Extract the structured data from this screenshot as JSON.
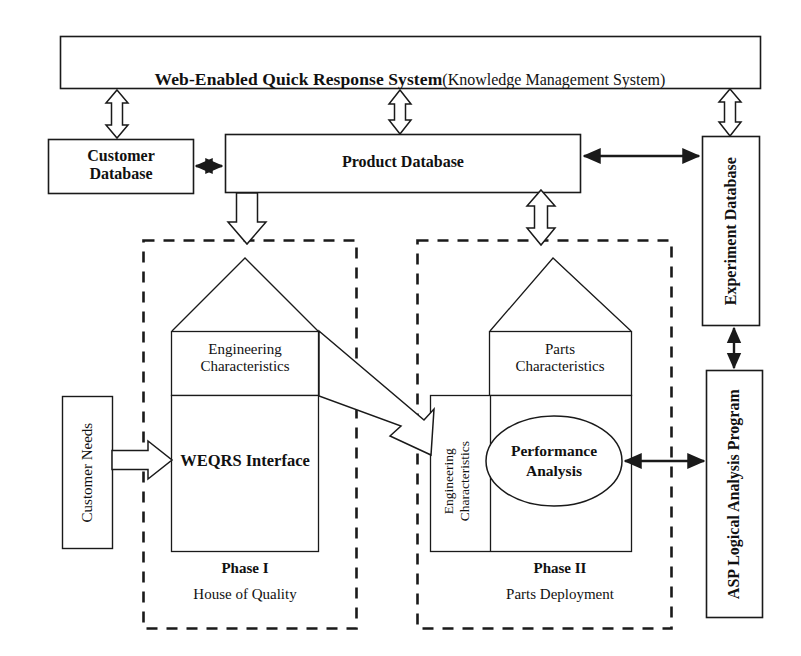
{
  "diagram": {
    "title_main": "Web-Enabled Quick Response System",
    "title_sub": "(Knowledge Management System)",
    "boxes": {
      "customer_database": "Customer\nDatabase",
      "product_database": "Product Database",
      "experiment_database": "Experiment Database",
      "asp_program": "ASP Logical Analysis Program",
      "customer_needs": "Customer Needs"
    },
    "phase1": {
      "roof_label": "Engineering\nCharacteristics",
      "body_label": "WEQRS Interface",
      "caption_title": "Phase I",
      "caption_sub": "House of Quality"
    },
    "phase2": {
      "roof_label": "Parts\nCharacteristics",
      "side_label": "Engineering\nCharacteristics",
      "ellipse_label": "Performance\nAnalysis",
      "caption_title": "Phase II",
      "caption_sub": "Parts Deployment"
    },
    "connectors": {
      "system_to_customer_db": "double-hollow-vertical-arrow",
      "system_to_product_db": "double-hollow-vertical-arrow",
      "system_to_experiment_db": "double-hollow-vertical-arrow",
      "customer_db_to_product_db": "double-solid-horizontal-arrow",
      "product_db_to_experiment_db": "double-solid-horizontal-arrow",
      "product_db_to_phase1": "hollow-down-arrow",
      "product_db_to_phase2": "double-hollow-vertical-arrow",
      "customer_needs_to_weqrs": "hollow-right-arrow",
      "phase1_to_phase2": "hollow-diagonal-arrow",
      "performance_to_asp": "double-solid-horizontal-arrow",
      "asp_to_experiment_db": "double-solid-vertical-arrow"
    },
    "colors": {
      "stroke": "#1a1a1a",
      "fill": "#ffffff",
      "text": "#111111"
    }
  }
}
